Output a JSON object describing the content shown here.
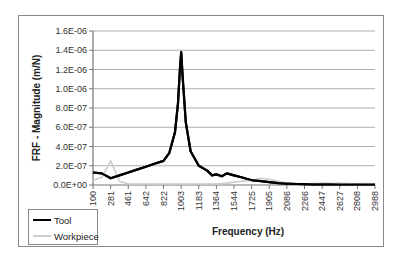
{
  "chart_data": {
    "type": "line",
    "title": "",
    "xlabel": "Frequency (Hz)",
    "ylabel": "FRF - Magnitude (m/N)",
    "ylim": [
      0,
      1.6e-06
    ],
    "y_ticks": [
      "0.0E+00",
      "2.0E-07",
      "4.0E-07",
      "6.0E-07",
      "8.0E-07",
      "1.0E-06",
      "1.2E-06",
      "1.4E-06",
      "1.6E-06"
    ],
    "x_ticks": [
      "100",
      "281",
      "461",
      "642",
      "822",
      "1003",
      "1183",
      "1364",
      "1544",
      "1725",
      "1905",
      "2086",
      "2266",
      "2447",
      "2627",
      "2808",
      "2988"
    ],
    "grid": "horizontal",
    "legend_position": "bottom-left",
    "x": [
      100,
      190,
      281,
      370,
      461,
      550,
      642,
      730,
      822,
      880,
      940,
      970,
      990,
      1003,
      1020,
      1050,
      1100,
      1183,
      1270,
      1320,
      1364,
      1420,
      1470,
      1544,
      1620,
      1725,
      1820,
      1905,
      2000,
      2086,
      2180,
      2266,
      2360,
      2447,
      2540,
      2627,
      2720,
      2808,
      2900,
      2988
    ],
    "series": [
      {
        "name": "Tool",
        "color": "#000000",
        "values": [
          1.3e-07,
          1.2e-07,
          7e-08,
          1e-07,
          1.3e-07,
          1.6e-07,
          1.9e-07,
          2.2e-07,
          2.5e-07,
          3.3e-07,
          5.5e-07,
          8.5e-07,
          1.2e-06,
          1.38e-06,
          1.1e-06,
          6.5e-07,
          3.5e-07,
          2e-07,
          1.5e-07,
          1e-07,
          1.1e-07,
          9e-08,
          1.2e-07,
          1e-07,
          8e-08,
          5e-08,
          4e-08,
          3e-08,
          2e-08,
          1.5e-08,
          1e-08,
          8e-09,
          7e-09,
          6e-09,
          6e-09,
          5e-09,
          5e-09,
          5e-09,
          5e-09,
          5e-09
        ]
      },
      {
        "name": "Workpiece",
        "color": "#cccccc",
        "values": [
          5e-08,
          8e-08,
          2.5e-07,
          4e-08,
          1e-08,
          1e-08,
          1e-08,
          1e-08,
          1e-08,
          1e-08,
          1e-08,
          1e-08,
          1e-08,
          1e-08,
          1e-08,
          1e-08,
          1e-08,
          1e-08,
          1e-08,
          1e-08,
          1e-08,
          1.5e-08,
          2e-08,
          3e-08,
          4e-08,
          5e-08,
          7e-08,
          6e-08,
          4e-08,
          2e-08,
          1.5e-08,
          1e-08,
          1.5e-08,
          2e-08,
          1.5e-08,
          2e-08,
          1.5e-08,
          1e-08,
          1.5e-08,
          1e-08
        ]
      }
    ]
  },
  "legend": {
    "items": [
      {
        "label": "Tool",
        "color": "#000000"
      },
      {
        "label": "Workpiece",
        "color": "#cccccc"
      }
    ]
  }
}
